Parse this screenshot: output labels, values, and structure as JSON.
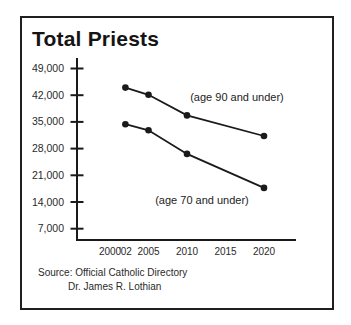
{
  "window": {
    "title": "Total Priests"
  },
  "chart_data": {
    "type": "line",
    "title": "Total Priests",
    "x": [
      2002,
      2005,
      2010,
      2020
    ],
    "x_tick_years": [
      2000,
      2002,
      2005,
      2010,
      2015,
      2020
    ],
    "x_tick_labels": [
      "2000",
      "'02",
      "2005",
      "2010",
      "2015",
      "2020"
    ],
    "y_tick_values": [
      49000,
      42000,
      35000,
      28000,
      21000,
      14000,
      7000
    ],
    "y_tick_labels": [
      "49,000",
      "42,000",
      "35,000",
      "28,000",
      "21,000",
      "14,000",
      "7,000"
    ],
    "ylim": [
      4500,
      51500
    ],
    "xlabel": "",
    "ylabel": "",
    "grid": false,
    "legend": "inline-annotations",
    "marker": "circle",
    "line_color": "#1a1a1a",
    "series": [
      {
        "name": "age 90 and under",
        "label": "(age 90 and under)",
        "values": [
          44000,
          42100,
          36700,
          31300
        ]
      },
      {
        "name": "age 70 and under",
        "label": "(age 70 and under)",
        "values": [
          34400,
          32800,
          26600,
          17700
        ]
      }
    ],
    "annotations": [
      {
        "text": "(age 90 and under)",
        "x": 237,
        "y": 101
      },
      {
        "text": "(age 70 and under)",
        "x": 202,
        "y": 204
      }
    ]
  },
  "source": {
    "line1": "Source: Official Catholic Directory",
    "line2": "Dr. James R. Lothian"
  }
}
